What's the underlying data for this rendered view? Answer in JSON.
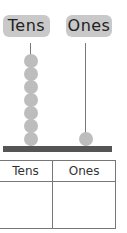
{
  "abacus": {
    "labels": {
      "tens": "Tens",
      "ones": "Ones"
    },
    "tens_beads": 7,
    "ones_beads": 1,
    "colors": {
      "label_bg": "#c9c9c9",
      "bead": "#bdbdbd",
      "rod": "#7a7a7a",
      "base": "#555555"
    }
  },
  "table": {
    "headers": [
      "Tens",
      "Ones"
    ],
    "values": [
      "",
      ""
    ]
  }
}
